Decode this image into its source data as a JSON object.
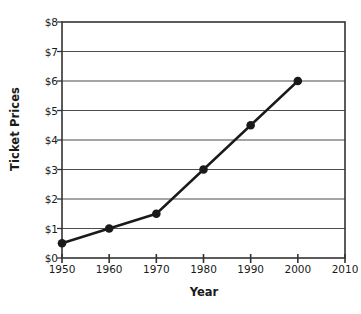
{
  "chart_data": {
    "type": "line",
    "title": "",
    "xlabel": "Year",
    "ylabel": "Ticket Prices",
    "x": [
      1950,
      1960,
      1970,
      1980,
      1990,
      2000
    ],
    "values": [
      0.5,
      1.0,
      1.5,
      3.0,
      4.5,
      6.0
    ],
    "series": [
      {
        "name": "Ticket Prices",
        "values": [
          0.5,
          1.0,
          1.5,
          3.0,
          4.5,
          6.0
        ]
      }
    ],
    "xlim": [
      1950,
      2010
    ],
    "ylim": [
      0,
      8
    ],
    "xticks": [
      1950,
      1960,
      1970,
      1980,
      1990,
      2000,
      2010
    ],
    "xtick_labels": [
      "1950",
      "1960",
      "1970",
      "1980",
      "1990",
      "2000",
      "2010"
    ],
    "yticks": [
      0,
      1,
      2,
      3,
      4,
      5,
      6,
      7,
      8
    ],
    "ytick_labels": [
      "$0",
      "$1",
      "$2",
      "$3",
      "$4",
      "$5",
      "$6",
      "$7",
      "$8"
    ],
    "grid": "horizontal",
    "legend": "none",
    "marker": "filled-circle",
    "line_color": "#1a1a1a",
    "marker_color": "#1a1a1a",
    "grid_color": "#4d4d4d",
    "axis_color": "#333333",
    "background_color": "#ffffff"
  }
}
